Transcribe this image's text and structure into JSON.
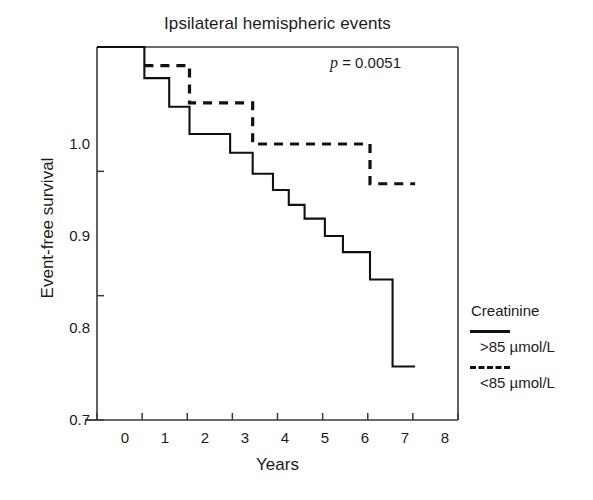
{
  "chart_data": {
    "type": "line",
    "title": "Ipsilateral hemispheric events",
    "xlabel": "Years",
    "ylabel": "Event-free survival",
    "xlim": [
      0,
      8
    ],
    "ylim": [
      0.7,
      1.0
    ],
    "xticks": [
      "0",
      "1",
      "2",
      "3",
      "4",
      "5",
      "6",
      "7",
      "8"
    ],
    "xtick_values": [
      0,
      1,
      2,
      3,
      4,
      5,
      6,
      7,
      8
    ],
    "yticks": [
      "1.0",
      "0.9",
      "0.8",
      "0.7"
    ],
    "ytick_values": [
      1.0,
      0.9,
      0.8,
      0.7
    ],
    "grid": false,
    "annotation": {
      "p_italic": "p",
      "p_rest": " = 0.0051"
    },
    "legend": {
      "position": "right",
      "title": "Creatinine",
      "entries": [
        {
          "label": ">85 µmol/L",
          "style": "solid",
          "color": "#111111"
        },
        {
          "label": "<85 µmol/L",
          "style": "dashed",
          "color": "#111111"
        }
      ]
    },
    "series": [
      {
        "name": ">85 µmol/L",
        "style": "solid",
        "color": "#111111",
        "step": "post",
        "x": [
          0.0,
          1.05,
          1.05,
          1.6,
          1.6,
          2.05,
          2.05,
          2.95,
          2.95,
          3.45,
          3.45,
          3.9,
          3.9,
          4.25,
          4.25,
          4.6,
          4.6,
          5.05,
          5.05,
          5.45,
          5.45,
          6.05,
          6.05,
          6.55,
          6.55,
          7.05
        ],
        "y": [
          1.0,
          1.0,
          0.975,
          0.975,
          0.952,
          0.952,
          0.93,
          0.93,
          0.915,
          0.915,
          0.898,
          0.898,
          0.885,
          0.885,
          0.873,
          0.873,
          0.862,
          0.862,
          0.848,
          0.848,
          0.835,
          0.835,
          0.813,
          0.813,
          0.743,
          0.743
        ]
      },
      {
        "name": "<85 µmol/L",
        "style": "dashed",
        "color": "#111111",
        "step": "post",
        "x": [
          1.05,
          2.05,
          2.05,
          3.45,
          3.45,
          6.05,
          6.05,
          7.05
        ],
        "y": [
          0.985,
          0.985,
          0.955,
          0.955,
          0.922,
          0.922,
          0.89,
          0.89
        ]
      }
    ]
  },
  "axes": {
    "plot_left": 97,
    "plot_right": 458,
    "plot_top": 47,
    "plot_bottom": 420
  }
}
